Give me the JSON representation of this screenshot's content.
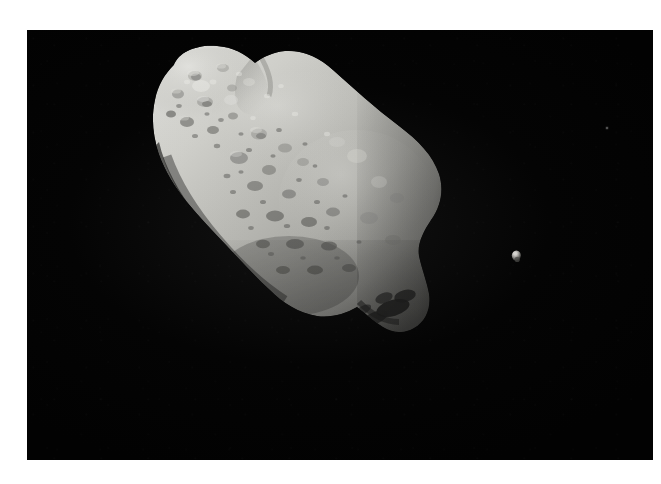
{
  "image": {
    "subject": "asteroid-with-moon",
    "background_color": "#ffffff",
    "plate_color": "#030303",
    "alt_text": "Grayscale space photograph of an irregular elongated cratered asteroid lit from the upper left, with a tiny bright moon to its right against a black sky"
  },
  "objects": {
    "asteroid": {
      "name": "asteroid-ida",
      "label": "243 Ida",
      "surface": "heavily cratered regolith",
      "lit_from": "upper-left",
      "highlight_color": "#d6d6d2",
      "midtone_color": "#a8a8a4",
      "shadow_color": "#3a3a38",
      "terminator_color": "#0e0e0d",
      "bounds": {
        "x": 152,
        "y": 152,
        "width": 293,
        "height": 190
      },
      "long_axis_orientation": "upper-left to lower-right"
    },
    "moon": {
      "name": "moon-dactyl",
      "label": "Dactyl",
      "highlight_color": "#cccac6",
      "shadow_color": "#2a2a28",
      "bounds": {
        "x": 509,
        "y": 248,
        "width": 16,
        "height": 18
      }
    },
    "background_specks": [
      {
        "name": "background-speck-upper",
        "x": 282,
        "y": 69
      },
      {
        "name": "background-speck-right",
        "x": 607,
        "y": 128
      }
    ]
  },
  "frame": {
    "name": "white-border",
    "left": 27,
    "top": 30,
    "right": 8,
    "bottom": 24,
    "color": "#ffffff"
  }
}
